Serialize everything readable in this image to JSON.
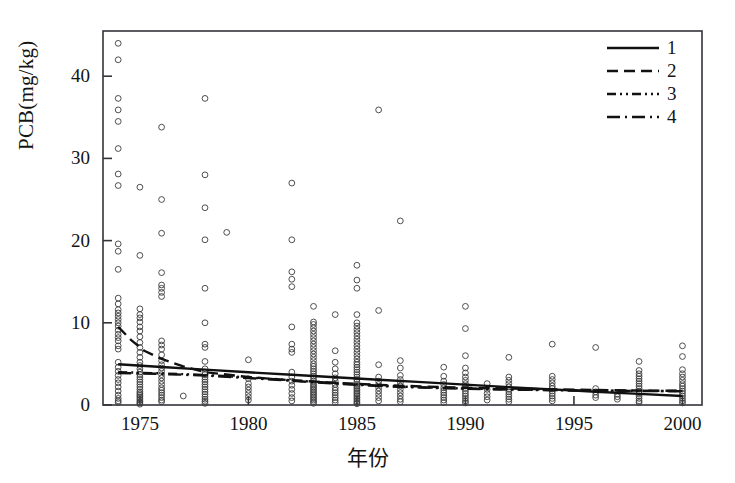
{
  "chart_data": {
    "type": "scatter",
    "title": "",
    "xlabel": "年份",
    "ylabel": "PCB(mg/kg)",
    "xlim": [
      1973.3,
      2000.9
    ],
    "ylim": [
      0,
      45.5
    ],
    "xticks": [
      1975,
      1980,
      1985,
      1990,
      1995,
      2000
    ],
    "xtick_labels": [
      "1975",
      "1980",
      "1985",
      "1990",
      "1995",
      "2000"
    ],
    "yticks": [
      0,
      10,
      20,
      30,
      40
    ],
    "ytick_labels": [
      "0",
      "10",
      "20",
      "30",
      "40"
    ],
    "grid": false,
    "marker": "open-circle",
    "marker_color": "#3c3c3c",
    "legend_position": "top-right",
    "legend": [
      {
        "label": "1",
        "style": "solid"
      },
      {
        "label": "2",
        "style": "dashed"
      },
      {
        "label": "3",
        "style": "dash-dot-dot"
      },
      {
        "label": "4",
        "style": "dash-dot"
      }
    ],
    "points": [
      [
        1974,
        44.0
      ],
      [
        1974,
        42.0
      ],
      [
        1974,
        37.3
      ],
      [
        1974,
        35.9
      ],
      [
        1974,
        34.5
      ],
      [
        1974,
        31.2
      ],
      [
        1974,
        28.1
      ],
      [
        1974,
        26.7
      ],
      [
        1974,
        19.6
      ],
      [
        1974,
        18.7
      ],
      [
        1974,
        16.5
      ],
      [
        1974,
        13.0
      ],
      [
        1974,
        12.3
      ],
      [
        1974,
        11.6
      ],
      [
        1974,
        11.2
      ],
      [
        1974,
        10.8
      ],
      [
        1974,
        10.4
      ],
      [
        1974,
        10.0
      ],
      [
        1974,
        9.6
      ],
      [
        1974,
        9.1
      ],
      [
        1974,
        8.6
      ],
      [
        1974,
        8.2
      ],
      [
        1974,
        7.8
      ],
      [
        1974,
        7.2
      ],
      [
        1974,
        6.8
      ],
      [
        1974,
        5.2
      ],
      [
        1974,
        4.6
      ],
      [
        1974,
        4.1
      ],
      [
        1974,
        3.6
      ],
      [
        1974,
        3.1
      ],
      [
        1974,
        2.7
      ],
      [
        1974,
        2.2
      ],
      [
        1974,
        1.7
      ],
      [
        1974,
        1.2
      ],
      [
        1974,
        0.8
      ],
      [
        1974,
        0.5
      ],
      [
        1974,
        0.3
      ],
      [
        1975,
        26.5
      ],
      [
        1975,
        18.2
      ],
      [
        1975,
        11.7
      ],
      [
        1975,
        11.0
      ],
      [
        1975,
        10.6
      ],
      [
        1975,
        10.1
      ],
      [
        1975,
        9.5
      ],
      [
        1975,
        9.0
      ],
      [
        1975,
        8.3
      ],
      [
        1975,
        7.6
      ],
      [
        1975,
        7.0
      ],
      [
        1975,
        6.4
      ],
      [
        1975,
        5.8
      ],
      [
        1975,
        5.2
      ],
      [
        1975,
        4.8
      ],
      [
        1975,
        4.4
      ],
      [
        1975,
        4.0
      ],
      [
        1975,
        3.7
      ],
      [
        1975,
        3.4
      ],
      [
        1975,
        3.1
      ],
      [
        1975,
        2.8
      ],
      [
        1975,
        2.5
      ],
      [
        1975,
        2.2
      ],
      [
        1975,
        1.9
      ],
      [
        1975,
        1.6
      ],
      [
        1975,
        1.4
      ],
      [
        1975,
        1.2
      ],
      [
        1975,
        1.0
      ],
      [
        1975,
        0.8
      ],
      [
        1975,
        0.6
      ],
      [
        1975,
        0.4
      ],
      [
        1975,
        0.25
      ],
      [
        1975,
        0.1
      ],
      [
        1976,
        33.8
      ],
      [
        1976,
        25.0
      ],
      [
        1976,
        20.9
      ],
      [
        1976,
        16.1
      ],
      [
        1976,
        14.6
      ],
      [
        1976,
        14.2
      ],
      [
        1976,
        13.7
      ],
      [
        1976,
        13.2
      ],
      [
        1976,
        7.8
      ],
      [
        1976,
        7.3
      ],
      [
        1976,
        6.8
      ],
      [
        1976,
        6.1
      ],
      [
        1976,
        5.4
      ],
      [
        1976,
        4.9
      ],
      [
        1976,
        4.5
      ],
      [
        1976,
        4.1
      ],
      [
        1976,
        3.7
      ],
      [
        1976,
        3.3
      ],
      [
        1976,
        2.9
      ],
      [
        1976,
        2.5
      ],
      [
        1976,
        2.1
      ],
      [
        1976,
        1.8
      ],
      [
        1976,
        1.5
      ],
      [
        1976,
        1.2
      ],
      [
        1976,
        0.9
      ],
      [
        1976,
        0.6
      ],
      [
        1976,
        0.4
      ],
      [
        1977,
        1.1
      ],
      [
        1978,
        37.3
      ],
      [
        1978,
        28.0
      ],
      [
        1978,
        24.0
      ],
      [
        1978,
        20.1
      ],
      [
        1978,
        14.2
      ],
      [
        1978,
        10.0
      ],
      [
        1978,
        7.4
      ],
      [
        1978,
        7.0
      ],
      [
        1978,
        5.3
      ],
      [
        1978,
        4.4
      ],
      [
        1978,
        4.0
      ],
      [
        1978,
        3.7
      ],
      [
        1978,
        3.4
      ],
      [
        1978,
        3.1
      ],
      [
        1978,
        2.8
      ],
      [
        1978,
        2.5
      ],
      [
        1978,
        2.2
      ],
      [
        1978,
        1.9
      ],
      [
        1978,
        1.6
      ],
      [
        1978,
        1.3
      ],
      [
        1978,
        1.0
      ],
      [
        1978,
        0.7
      ],
      [
        1978,
        0.45
      ],
      [
        1978,
        0.2
      ],
      [
        1979,
        21.0
      ],
      [
        1980,
        5.5
      ],
      [
        1980,
        3.2
      ],
      [
        1980,
        2.6
      ],
      [
        1980,
        2.2
      ],
      [
        1980,
        1.8
      ],
      [
        1980,
        1.4
      ],
      [
        1980,
        1.0
      ],
      [
        1980,
        0.6
      ],
      [
        1982,
        27.0
      ],
      [
        1982,
        20.1
      ],
      [
        1982,
        16.2
      ],
      [
        1982,
        15.3
      ],
      [
        1982,
        14.4
      ],
      [
        1982,
        9.5
      ],
      [
        1982,
        7.4
      ],
      [
        1982,
        6.8
      ],
      [
        1982,
        6.4
      ],
      [
        1982,
        4.0
      ],
      [
        1982,
        3.4
      ],
      [
        1982,
        2.9
      ],
      [
        1982,
        2.4
      ],
      [
        1982,
        1.9
      ],
      [
        1982,
        1.4
      ],
      [
        1982,
        0.9
      ],
      [
        1982,
        0.5
      ],
      [
        1983,
        12.0
      ],
      [
        1983,
        10.1
      ],
      [
        1983,
        9.8
      ],
      [
        1983,
        9.4
      ],
      [
        1983,
        9.0
      ],
      [
        1983,
        8.6
      ],
      [
        1983,
        8.2
      ],
      [
        1983,
        7.8
      ],
      [
        1983,
        7.4
      ],
      [
        1983,
        7.0
      ],
      [
        1983,
        6.6
      ],
      [
        1983,
        6.2
      ],
      [
        1983,
        5.8
      ],
      [
        1983,
        5.4
      ],
      [
        1983,
        5.0
      ],
      [
        1983,
        4.7
      ],
      [
        1983,
        4.4
      ],
      [
        1983,
        4.1
      ],
      [
        1983,
        3.8
      ],
      [
        1983,
        3.5
      ],
      [
        1983,
        3.2
      ],
      [
        1983,
        2.9
      ],
      [
        1983,
        2.6
      ],
      [
        1983,
        2.4
      ],
      [
        1983,
        2.2
      ],
      [
        1983,
        2.0
      ],
      [
        1983,
        1.8
      ],
      [
        1983,
        1.6
      ],
      [
        1983,
        1.4
      ],
      [
        1983,
        1.2
      ],
      [
        1983,
        1.0
      ],
      [
        1983,
        0.8
      ],
      [
        1983,
        0.6
      ],
      [
        1983,
        0.4
      ],
      [
        1983,
        0.2
      ],
      [
        1984,
        11.0
      ],
      [
        1984,
        6.6
      ],
      [
        1984,
        5.2
      ],
      [
        1984,
        4.4
      ],
      [
        1984,
        3.8
      ],
      [
        1984,
        3.3
      ],
      [
        1984,
        2.9
      ],
      [
        1984,
        2.5
      ],
      [
        1984,
        2.1
      ],
      [
        1984,
        1.8
      ],
      [
        1984,
        1.5
      ],
      [
        1984,
        1.2
      ],
      [
        1984,
        0.9
      ],
      [
        1984,
        0.6
      ],
      [
        1984,
        0.3
      ],
      [
        1985,
        17.0
      ],
      [
        1985,
        15.2
      ],
      [
        1985,
        14.2
      ],
      [
        1985,
        11.0
      ],
      [
        1985,
        10.0
      ],
      [
        1985,
        9.6
      ],
      [
        1985,
        9.2
      ],
      [
        1985,
        8.8
      ],
      [
        1985,
        8.4
      ],
      [
        1985,
        8.0
      ],
      [
        1985,
        7.6
      ],
      [
        1985,
        7.2
      ],
      [
        1985,
        6.8
      ],
      [
        1985,
        6.4
      ],
      [
        1985,
        6.0
      ],
      [
        1985,
        5.6
      ],
      [
        1985,
        5.2
      ],
      [
        1985,
        4.9
      ],
      [
        1985,
        4.6
      ],
      [
        1985,
        4.3
      ],
      [
        1985,
        4.0
      ],
      [
        1985,
        3.7
      ],
      [
        1985,
        3.4
      ],
      [
        1985,
        3.1
      ],
      [
        1985,
        2.8
      ],
      [
        1985,
        2.5
      ],
      [
        1985,
        2.3
      ],
      [
        1985,
        2.1
      ],
      [
        1985,
        1.9
      ],
      [
        1985,
        1.7
      ],
      [
        1985,
        1.5
      ],
      [
        1985,
        1.3
      ],
      [
        1985,
        1.1
      ],
      [
        1985,
        0.9
      ],
      [
        1985,
        0.7
      ],
      [
        1985,
        0.5
      ],
      [
        1985,
        0.3
      ],
      [
        1985,
        0.15
      ],
      [
        1986,
        35.9
      ],
      [
        1986,
        11.5
      ],
      [
        1986,
        4.9
      ],
      [
        1986,
        3.4
      ],
      [
        1986,
        2.9
      ],
      [
        1986,
        2.5
      ],
      [
        1986,
        2.1
      ],
      [
        1986,
        1.7
      ],
      [
        1986,
        1.3
      ],
      [
        1986,
        0.9
      ],
      [
        1986,
        0.5
      ],
      [
        1987,
        22.4
      ],
      [
        1987,
        5.4
      ],
      [
        1987,
        4.5
      ],
      [
        1987,
        3.6
      ],
      [
        1987,
        3.1
      ],
      [
        1987,
        2.7
      ],
      [
        1987,
        2.3
      ],
      [
        1987,
        1.9
      ],
      [
        1987,
        1.5
      ],
      [
        1987,
        1.1
      ],
      [
        1987,
        0.7
      ],
      [
        1987,
        0.4
      ],
      [
        1989,
        4.6
      ],
      [
        1989,
        3.5
      ],
      [
        1989,
        2.9
      ],
      [
        1989,
        2.5
      ],
      [
        1989,
        2.1
      ],
      [
        1989,
        1.8
      ],
      [
        1989,
        1.5
      ],
      [
        1989,
        1.2
      ],
      [
        1989,
        0.9
      ],
      [
        1989,
        0.6
      ],
      [
        1989,
        0.3
      ],
      [
        1990,
        12.0
      ],
      [
        1990,
        9.3
      ],
      [
        1990,
        6.0
      ],
      [
        1990,
        4.5
      ],
      [
        1990,
        3.9
      ],
      [
        1990,
        3.4
      ],
      [
        1990,
        3.0
      ],
      [
        1990,
        2.6
      ],
      [
        1990,
        2.3
      ],
      [
        1990,
        2.0
      ],
      [
        1990,
        1.7
      ],
      [
        1990,
        1.4
      ],
      [
        1990,
        1.1
      ],
      [
        1990,
        0.8
      ],
      [
        1990,
        0.5
      ],
      [
        1990,
        0.25
      ],
      [
        1991,
        2.6
      ],
      [
        1991,
        1.9
      ],
      [
        1991,
        1.4
      ],
      [
        1991,
        1.0
      ],
      [
        1991,
        0.6
      ],
      [
        1992,
        5.8
      ],
      [
        1992,
        3.4
      ],
      [
        1992,
        3.0
      ],
      [
        1992,
        2.6
      ],
      [
        1992,
        2.2
      ],
      [
        1992,
        1.9
      ],
      [
        1992,
        1.6
      ],
      [
        1992,
        1.3
      ],
      [
        1992,
        1.0
      ],
      [
        1992,
        0.7
      ],
      [
        1992,
        0.4
      ],
      [
        1994,
        7.4
      ],
      [
        1994,
        3.5
      ],
      [
        1994,
        3.1
      ],
      [
        1994,
        2.7
      ],
      [
        1994,
        2.3
      ],
      [
        1994,
        2.0
      ],
      [
        1994,
        1.7
      ],
      [
        1994,
        1.4
      ],
      [
        1994,
        1.1
      ],
      [
        1994,
        0.8
      ],
      [
        1994,
        0.5
      ],
      [
        1996,
        7.0
      ],
      [
        1996,
        2.0
      ],
      [
        1996,
        1.6
      ],
      [
        1996,
        1.2
      ],
      [
        1996,
        0.9
      ],
      [
        1997,
        1.3
      ],
      [
        1997,
        1.0
      ],
      [
        1997,
        0.7
      ],
      [
        1998,
        5.3
      ],
      [
        1998,
        4.2
      ],
      [
        1998,
        3.8
      ],
      [
        1998,
        3.5
      ],
      [
        1998,
        3.2
      ],
      [
        1998,
        2.9
      ],
      [
        1998,
        2.6
      ],
      [
        1998,
        2.3
      ],
      [
        1998,
        2.0
      ],
      [
        1998,
        1.7
      ],
      [
        1998,
        1.4
      ],
      [
        1998,
        1.1
      ],
      [
        1998,
        0.8
      ],
      [
        1998,
        0.5
      ],
      [
        1998,
        0.3
      ],
      [
        2000,
        7.2
      ],
      [
        2000,
        5.9
      ],
      [
        2000,
        4.3
      ],
      [
        2000,
        3.8
      ],
      [
        2000,
        3.4
      ],
      [
        2000,
        3.0
      ],
      [
        2000,
        2.6
      ],
      [
        2000,
        2.3
      ],
      [
        2000,
        2.0
      ],
      [
        2000,
        1.7
      ],
      [
        2000,
        1.4
      ],
      [
        2000,
        1.1
      ],
      [
        2000,
        0.8
      ],
      [
        2000,
        0.5
      ],
      [
        2000,
        0.25
      ]
    ],
    "series": [
      {
        "name": "1",
        "style": "solid",
        "x": [
          1974,
          1976,
          1978,
          1980,
          1982,
          1984,
          1986,
          1988,
          1990,
          1992,
          1994,
          1996,
          1998,
          2000
        ],
        "values": [
          4.95,
          4.62,
          4.3,
          3.98,
          3.68,
          3.38,
          3.08,
          2.78,
          2.48,
          2.18,
          1.9,
          1.62,
          1.35,
          1.1
        ]
      },
      {
        "name": "2",
        "style": "dashed",
        "x": [
          1974,
          1974.6,
          1975.2,
          1976,
          1977,
          1978,
          1980,
          1982,
          1984,
          1986,
          1988,
          1990,
          1992,
          1994,
          1996,
          1998,
          2000
        ],
        "values": [
          9.5,
          7.9,
          6.6,
          5.6,
          4.7,
          4.0,
          3.4,
          3.0,
          2.7,
          2.45,
          2.25,
          2.1,
          2.0,
          1.9,
          1.82,
          1.76,
          1.72
        ]
      },
      {
        "name": "3",
        "style": "dash-dot-dot",
        "x": [
          1974,
          1976,
          1978,
          1980,
          1982,
          1984,
          1986,
          1988,
          1990,
          1992,
          1994,
          1996,
          1998,
          2000
        ],
        "values": [
          4.0,
          3.85,
          3.65,
          3.35,
          3.0,
          2.65,
          2.35,
          2.15,
          2.0,
          1.9,
          1.82,
          1.76,
          1.72,
          1.7
        ]
      },
      {
        "name": "4",
        "style": "dash-dot",
        "x": [
          1974,
          1976,
          1978,
          1980,
          1982,
          1984,
          1986,
          1988,
          1990,
          1992,
          1994,
          1996,
          1998,
          2000
        ],
        "values": [
          3.9,
          3.78,
          3.58,
          3.28,
          2.95,
          2.6,
          2.32,
          2.12,
          1.98,
          1.88,
          1.8,
          1.75,
          1.71,
          1.68
        ]
      }
    ]
  },
  "axes": {
    "y_title": "PCB(mg/kg)",
    "x_title": "年份"
  }
}
